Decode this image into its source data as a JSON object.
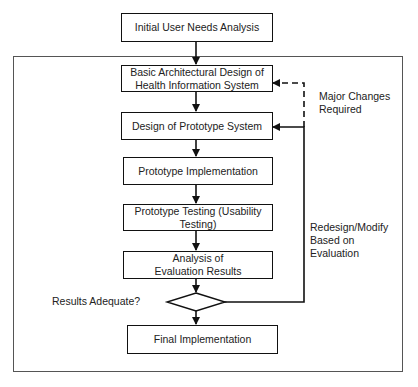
{
  "diagram": {
    "nodes": [
      {
        "id": "initial-analysis",
        "label": "Initial User Needs Analysis"
      },
      {
        "id": "architectural-design",
        "label": "Basic Architectural Design of Health Information System"
      },
      {
        "id": "prototype-design",
        "label": "Design of Prototype System"
      },
      {
        "id": "prototype-implementation",
        "label": "Prototype Implementation"
      },
      {
        "id": "prototype-testing",
        "label": "Prototype Testing  (Usability Testing)"
      },
      {
        "id": "evaluation-analysis",
        "label": "Analysis of Evaluation Results"
      },
      {
        "id": "decision",
        "label": "Results Adequate?"
      },
      {
        "id": "final-implementation",
        "label": "Final Implementation"
      }
    ],
    "annotations": {
      "major_changes": "Major Changes Required",
      "redesign": "Redesign/Modify Based on Evaluation"
    },
    "edges": [
      {
        "from": "initial-analysis",
        "to": "architectural-design",
        "style": "solid"
      },
      {
        "from": "architectural-design",
        "to": "prototype-design",
        "style": "solid"
      },
      {
        "from": "prototype-design",
        "to": "prototype-implementation",
        "style": "solid"
      },
      {
        "from": "prototype-implementation",
        "to": "prototype-testing",
        "style": "solid"
      },
      {
        "from": "prototype-testing",
        "to": "evaluation-analysis",
        "style": "solid"
      },
      {
        "from": "evaluation-analysis",
        "to": "decision",
        "style": "solid"
      },
      {
        "from": "decision",
        "to": "final-implementation",
        "style": "solid"
      },
      {
        "from": "decision",
        "to": "prototype-design",
        "style": "solid",
        "label": "Redesign/Modify Based on Evaluation"
      },
      {
        "from": "decision",
        "to": "architectural-design",
        "style": "dashed",
        "label": "Major Changes Required"
      }
    ]
  }
}
